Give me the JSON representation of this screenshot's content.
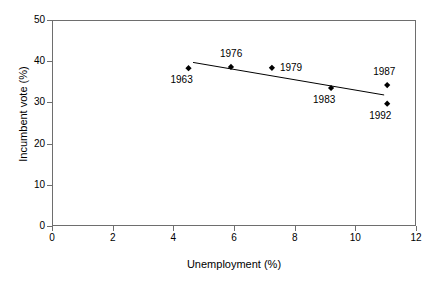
{
  "chart_data": {
    "type": "scatter",
    "title": "",
    "xlabel": "Unemployment (%)",
    "ylabel": "Incumbent vote (%)",
    "xlim": [
      0,
      12
    ],
    "ylim": [
      0,
      50
    ],
    "xticks": [
      0,
      2,
      4,
      6,
      8,
      10,
      12
    ],
    "yticks": [
      0,
      10,
      20,
      30,
      40,
      50
    ],
    "grid": false,
    "legend": "none",
    "marker": "diamond",
    "marker_color": "#000000",
    "points": [
      {
        "label": "1963",
        "x": 4.5,
        "y": 38.3,
        "label_pos": "below-left"
      },
      {
        "label": "1976",
        "x": 5.9,
        "y": 38.6,
        "label_pos": "above"
      },
      {
        "label": "1979",
        "x": 7.25,
        "y": 38.4,
        "label_pos": "right"
      },
      {
        "label": "1983",
        "x": 9.2,
        "y": 33.5,
        "label_pos": "below-left"
      },
      {
        "label": "1987",
        "x": 11.05,
        "y": 34.2,
        "label_pos": "above-left"
      },
      {
        "label": "1992",
        "x": 11.05,
        "y": 29.7,
        "label_pos": "below-left"
      }
    ],
    "trendline": {
      "x_start": 4.65,
      "y_start": 39.7,
      "x_end": 10.95,
      "y_end": 31.8,
      "color": "#000000"
    }
  },
  "axes": {
    "x_tick_labels": [
      "0",
      "2",
      "4",
      "6",
      "8",
      "10",
      "12"
    ],
    "y_tick_labels": [
      "0",
      "10",
      "20",
      "30",
      "40",
      "50"
    ],
    "x_title": "Unemployment (%)",
    "y_title": "Incumbent vote (%)"
  },
  "colors": {
    "axis": "#6e6e6e",
    "marker": "#000000",
    "line": "#000000",
    "text": "#000000",
    "background": "#ffffff"
  }
}
